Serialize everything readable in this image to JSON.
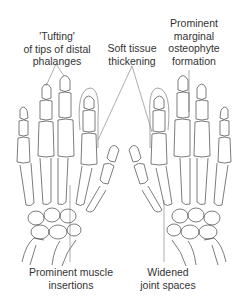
{
  "figure": {
    "labels": {
      "tufting": {
        "lines": [
          "'Tufting'",
          "of tips of distal",
          "phalanges"
        ]
      },
      "soft_tissue": {
        "lines": [
          "Soft tissue",
          "thickening"
        ]
      },
      "osteophyte": {
        "lines": [
          "Prominent",
          "marginal",
          "osteophyte",
          "formation"
        ]
      },
      "muscle": {
        "lines": [
          "Prominent muscle",
          "insertions"
        ]
      },
      "joint": {
        "lines": [
          "Widened",
          "joint spaces"
        ]
      }
    },
    "colors": {
      "line": "#444444",
      "text": "#333333",
      "background": "#ffffff"
    }
  }
}
